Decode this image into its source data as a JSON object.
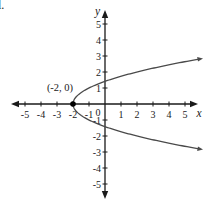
{
  "page": {
    "corner_fragment": "l."
  },
  "chart_data": {
    "type": "line",
    "subtype": "horizontal-parabola",
    "title": "",
    "equation": "x = y^2 - 2",
    "opens": "right",
    "vertex": {
      "x": -2,
      "y": 0
    },
    "vertex_label": "(-2, 0)",
    "x_axis": {
      "label": "x",
      "min": -5,
      "max": 5,
      "ticks": [
        -5,
        -4,
        -3,
        -2,
        -1,
        1,
        2,
        3,
        4,
        5
      ],
      "tick_labels": [
        "-5",
        "-4",
        "-3",
        "-2",
        "-1",
        "1",
        "2",
        "3",
        "4",
        "5"
      ]
    },
    "y_axis": {
      "label": "y",
      "min": -5,
      "max": 5,
      "ticks": [
        5,
        4,
        3,
        2,
        1,
        -1,
        -2,
        -3,
        -4,
        -5
      ],
      "tick_labels": [
        "5",
        "4",
        "3",
        "2",
        "1",
        "-1",
        "-2",
        "-3",
        "-4",
        "-5"
      ]
    },
    "origin_label": "0",
    "curve_y_range": [
      -2.79,
      2.79
    ],
    "points": [
      [
        -2,
        0
      ],
      [
        -1,
        1
      ],
      [
        -1,
        -1
      ],
      [
        2,
        2
      ],
      [
        2,
        -2
      ],
      [
        5.8,
        2.79
      ],
      [
        5.8,
        -2.79
      ]
    ],
    "grid": false,
    "legend": false,
    "axis_color": "#1a1a1a",
    "curve_color": "#4a4a4a",
    "point_color": "#000000"
  }
}
